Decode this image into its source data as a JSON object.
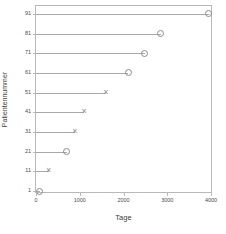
{
  "chart_data": {
    "type": "scatter",
    "title": "",
    "subtitle": "",
    "xlabel": "Tage",
    "ylabel": "Patientennummer",
    "xlim": [
      0,
      4000
    ],
    "ylim": [
      0.5,
      95
    ],
    "grid": false,
    "legend_position": "none",
    "xticks": [
      0,
      1000,
      2000,
      3000,
      4000
    ],
    "xtick_labels": [
      "0",
      "1000",
      "2000",
      "3000",
      "4000"
    ],
    "yticks": [
      1,
      11,
      21,
      31,
      41,
      51,
      61,
      71,
      81,
      91
    ],
    "ytick_labels": [
      "1",
      "11",
      "21",
      "31",
      "41",
      "51",
      "61",
      "71",
      "81",
      "91"
    ],
    "marker_styles": {
      "circle": "open-circle",
      "cross": "x-cross"
    },
    "series": [
      {
        "name": "Beobachtungszeit",
        "type": "lollipop-lines",
        "points": [
          {
            "patient": 1,
            "tage": 90,
            "marker": "circle"
          },
          {
            "patient": 11,
            "tage": 290,
            "marker": "cross"
          },
          {
            "patient": 21,
            "tage": 700,
            "marker": "circle"
          },
          {
            "patient": 31,
            "tage": 890,
            "marker": "cross"
          },
          {
            "patient": 41,
            "tage": 1100,
            "marker": "cross"
          },
          {
            "patient": 51,
            "tage": 1600,
            "marker": "cross"
          },
          {
            "patient": 61,
            "tage": 2110,
            "marker": "circle"
          },
          {
            "patient": 71,
            "tage": 2490,
            "marker": "circle"
          },
          {
            "patient": 81,
            "tage": 2850,
            "marker": "circle"
          },
          {
            "patient": 91,
            "tage": 3950,
            "marker": "circle"
          }
        ]
      }
    ],
    "colors": {
      "line": "#a8a8a8",
      "marker": "#8c8c8c",
      "frame": "#b9b9b9",
      "text": "#3d3d3d",
      "background": "#ffffff"
    }
  }
}
